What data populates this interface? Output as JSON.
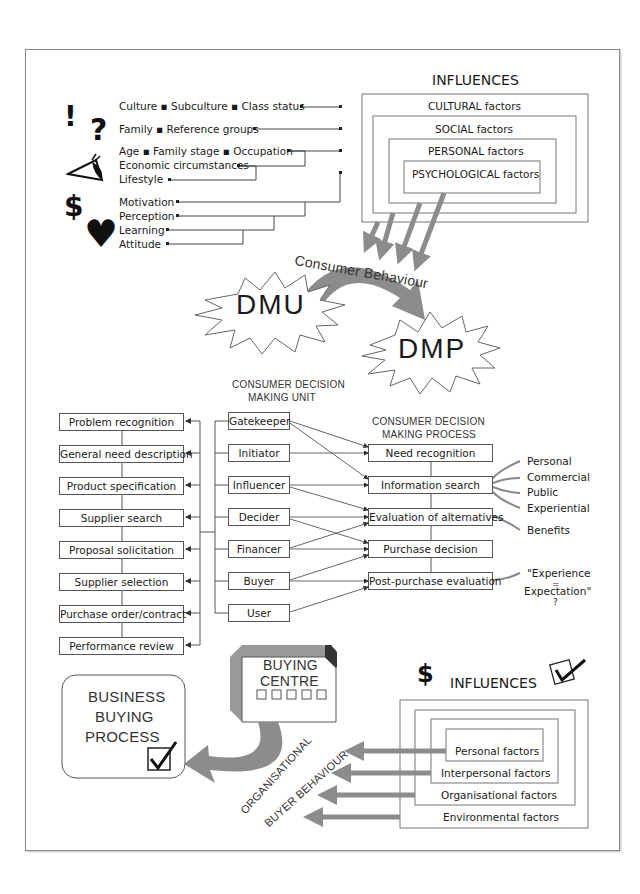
{
  "top_influences": {
    "title": "INFLUENCES",
    "layers": [
      "CULTURAL factors",
      "SOCIAL factors",
      "PERSONAL factors",
      "PSYCHOLOGICAL factors"
    ]
  },
  "factor_groups": [
    {
      "icon": "exclamation-icon",
      "lines": [
        "Culture ▪ Subculture ▪ Class status"
      ]
    },
    {
      "icon": "question-icon",
      "lines": [
        "Family ▪ Reference groups"
      ]
    },
    {
      "icon": "eye-icon",
      "lines": [
        "Age ▪ Family stage ▪ Occupation",
        "Economic circumstances",
        "Lifestyle"
      ]
    },
    {
      "icon": "dollar-heart-icon",
      "lines": [
        "Motivation",
        "Perception",
        "Learning",
        "Attitude"
      ]
    }
  ],
  "icons": {
    "exclamation": "!",
    "question": "?",
    "dollar": "$",
    "heart": "♥"
  },
  "consumer_behaviour_label": "Consumer Behaviour",
  "dmu": {
    "label": "DMU",
    "caption_line1": "CONSUMER DECISION",
    "caption_line2": "MAKING UNIT"
  },
  "dmp": {
    "label": "DMP",
    "caption_line1": "CONSUMER DECISION",
    "caption_line2": "MAKING PROCESS"
  },
  "business_process_steps": [
    "Problem recognition",
    "General need description",
    "Product specification",
    "Supplier search",
    "Proposal solicitation",
    "Supplier selection",
    "Purchase order/contract",
    "Performance review"
  ],
  "dmu_roles": [
    "Gatekeeper",
    "Initiator",
    "Influencer",
    "Decider",
    "Financer",
    "Buyer",
    "User"
  ],
  "dmp_steps": [
    "Need recognition",
    "Information search",
    "Evaluation of alternatives",
    "Purchase decision",
    "Post-purchase evaluation"
  ],
  "role_to_step_links": [
    {
      "role": "Gatekeeper",
      "steps": [
        "Need recognition",
        "Information search"
      ]
    },
    {
      "role": "Initiator",
      "steps": [
        "Need recognition"
      ]
    },
    {
      "role": "Influencer",
      "steps": [
        "Information search",
        "Evaluation of alternatives"
      ]
    },
    {
      "role": "Decider",
      "steps": [
        "Evaluation of alternatives",
        "Purchase decision"
      ]
    },
    {
      "role": "Financer",
      "steps": [
        "Evaluation of alternatives",
        "Purchase decision"
      ]
    },
    {
      "role": "Buyer",
      "steps": [
        "Purchase decision",
        "Post-purchase evaluation"
      ]
    },
    {
      "role": "User",
      "steps": [
        "Post-purchase evaluation"
      ]
    }
  ],
  "information_sources": [
    "Personal",
    "Commercial",
    "Public",
    "Experiential"
  ],
  "evaluation_note": "Benefits",
  "post_purchase_note": {
    "line1": "\"Experience",
    "line2": "=",
    "line3": "Expectation\"",
    "line4": "?"
  },
  "buying_centre": {
    "line1": "BUYING",
    "line2": "CENTRE"
  },
  "business_buying": {
    "line1": "BUSINESS",
    "line2": "BUYING",
    "line3": "PROCESS"
  },
  "organisational_label": {
    "line1": "ORGANISATIONAL",
    "line2": "BUYER BEHAVIOUR"
  },
  "bottom_influences": {
    "title": "INFLUENCES",
    "layers": [
      "Environmental factors",
      "Organisational factors",
      "Interpersonal factors",
      "Personal factors"
    ]
  },
  "colors": {
    "arrow_gray": "#8c8c8c",
    "line": "#555555",
    "frame": "#8a8a8a"
  }
}
